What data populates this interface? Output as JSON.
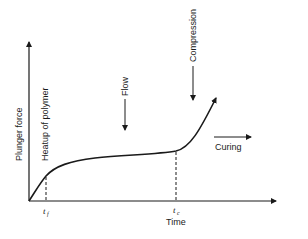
{
  "diagram": {
    "y_axis_label": "Plunger force",
    "x_axis_label": "Time",
    "annotations": {
      "heatup": "Heatup of polymer",
      "flow": "Flow",
      "compression": "Compression",
      "curing": "Curing"
    },
    "ticks": {
      "tf": {
        "main": "t",
        "sub": "f"
      },
      "tc": {
        "main": "t",
        "sub": "c"
      }
    },
    "colors": {
      "ink": "#1a1a1a",
      "background": "#ffffff"
    }
  }
}
